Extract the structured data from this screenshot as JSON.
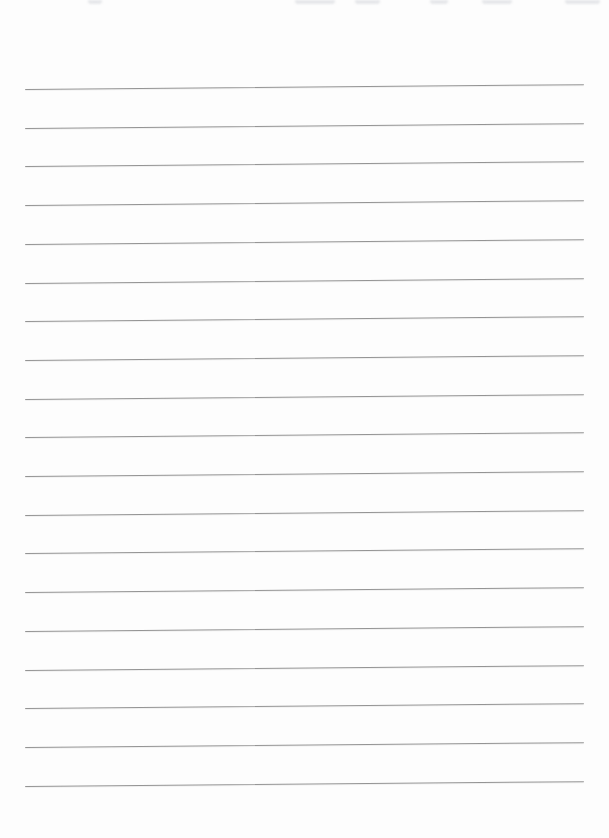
{
  "document": {
    "type": "blank-lined-notebook-page",
    "background_color": "#fdfdfd",
    "ruled_lines": {
      "count": 19,
      "first_y": 89,
      "spacing": 38.7,
      "left_x": 25,
      "right_x": 584,
      "thickness_px": 1,
      "color": "#949494",
      "tilt_deg": -0.5
    },
    "top_edge_artifacts": {
      "color": "rgba(178,183,192,0.30)",
      "marks": [
        {
          "x": 88,
          "width": 14
        },
        {
          "x": 295,
          "width": 40
        },
        {
          "x": 355,
          "width": 25
        },
        {
          "x": 430,
          "width": 18
        },
        {
          "x": 482,
          "width": 30
        },
        {
          "x": 565,
          "width": 35
        }
      ]
    }
  }
}
